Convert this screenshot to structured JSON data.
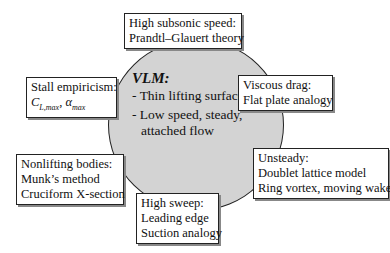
{
  "center": {
    "title": "VLM:",
    "items": [
      "- Thin lifting surfaces",
      "- Low speed, steady, attached flow"
    ],
    "fill_color": "#d3d3d3"
  },
  "boxes": {
    "high_subsonic": {
      "line1": "High subsonic speed:",
      "line2": "Prandtl–Glauert theory"
    },
    "stall": {
      "line1": "Stall empiricism:",
      "cl": "C",
      "cl_sub": "L,max",
      "sep": ", ",
      "alpha": "α",
      "alpha_sub": "max"
    },
    "viscous": {
      "line1": "Viscous drag:",
      "line2": "Flat plate analogy"
    },
    "nonlifting": {
      "line1": "Nonlifting bodies:",
      "line2": "Munk’s method",
      "line3": "Cruciform X-section"
    },
    "unsteady": {
      "line1": "Unsteady:",
      "line2": "Doublet lattice model",
      "line3": "Ring vortex, moving wake"
    },
    "high_sweep": {
      "line1": "High sweep:",
      "line2": "Leading edge",
      "line3": "Suction analogy"
    }
  }
}
